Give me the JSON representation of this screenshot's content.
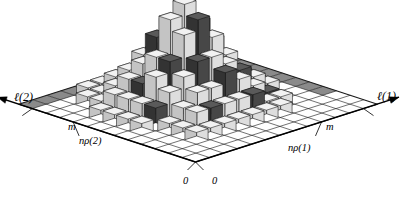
{
  "figure": {
    "title": "",
    "background": "#ffffff",
    "width": 410,
    "height": 204
  },
  "axes": {
    "x_axis_label": "ℓ(1)",
    "y_axis_label": "ℓ(2)",
    "x_origin_label": "0",
    "y_origin_label": "0",
    "x_m_label": "m",
    "y_m_label": "m",
    "x_rho_label": "nρ(1)",
    "y_rho_label": "nρ(2)"
  },
  "colors": {
    "grid_line": "#1a1a1a",
    "floor_fill": "#ffffff",
    "floor_shaded": "#8a8a8a",
    "bar_top_light": "#f2f2f2",
    "bar_left_light": "#c4c4c4",
    "bar_right_light": "#dedede",
    "bar_top_dark": "#5a5a5a",
    "bar_left_dark": "#333333",
    "bar_right_dark": "#474747",
    "outline": "#111111",
    "axis_arrow": "#000000"
  },
  "chart_data": {
    "type": "bar",
    "subtype": "3d-bar-histogram",
    "title": "",
    "xlabel": "ℓ(1)",
    "ylabel": "ℓ(2)",
    "zlabel": "",
    "grid": true,
    "legend_position": "none",
    "x_ticks": [
      "0",
      "nρ(1)",
      "m"
    ],
    "y_ticks": [
      "0",
      "nρ(2)",
      "m"
    ],
    "nx": 13,
    "ny": 13,
    "xlim": [
      0,
      13
    ],
    "ylim": [
      0,
      13
    ],
    "zlim": [
      0,
      9
    ],
    "tick_index": {
      "x_rho": 9,
      "y_rho": 9,
      "x_m": 12,
      "y_m": 12
    },
    "heights": [
      [
        0,
        0,
        0,
        0,
        0,
        0,
        0,
        0,
        0,
        0,
        0,
        0,
        0
      ],
      [
        0,
        0,
        0,
        0,
        0,
        0,
        0,
        0,
        0,
        0,
        0,
        0,
        0
      ],
      [
        0,
        0,
        1,
        1,
        1,
        1,
        1,
        1,
        1,
        0,
        0,
        0,
        0
      ],
      [
        0,
        0,
        1,
        2,
        2,
        2,
        2,
        2,
        1,
        1,
        0,
        0,
        0
      ],
      [
        0,
        0,
        1,
        2,
        3,
        3,
        4,
        3,
        2,
        1,
        0,
        0,
        0
      ],
      [
        0,
        1,
        2,
        3,
        4,
        5,
        5,
        4,
        3,
        2,
        1,
        0,
        0
      ],
      [
        0,
        1,
        2,
        4,
        5,
        7,
        8,
        6,
        4,
        2,
        1,
        0,
        0
      ],
      [
        0,
        1,
        2,
        3,
        5,
        8,
        9,
        7,
        5,
        2,
        1,
        0,
        0
      ],
      [
        0,
        1,
        2,
        3,
        4,
        6,
        7,
        5,
        3,
        2,
        1,
        0,
        0
      ],
      [
        0,
        0,
        1,
        2,
        3,
        4,
        4,
        3,
        2,
        1,
        0,
        0,
        0
      ],
      [
        0,
        0,
        1,
        1,
        2,
        2,
        2,
        2,
        1,
        1,
        0,
        0,
        0
      ],
      [
        0,
        0,
        0,
        1,
        1,
        1,
        1,
        1,
        0,
        0,
        0,
        0,
        0
      ],
      [
        0,
        0,
        0,
        0,
        0,
        0,
        0,
        0,
        0,
        0,
        0,
        0,
        0
      ]
    ],
    "dark_cells": [
      [
        4,
        6
      ],
      [
        5,
        5
      ],
      [
        5,
        8
      ],
      [
        6,
        4
      ],
      [
        6,
        6
      ],
      [
        6,
        9
      ],
      [
        7,
        3
      ],
      [
        7,
        7
      ],
      [
        8,
        5
      ],
      [
        8,
        9
      ],
      [
        9,
        4
      ],
      [
        9,
        7
      ],
      [
        3,
        7
      ],
      [
        10,
        6
      ],
      [
        2,
        5
      ],
      [
        11,
        5
      ],
      [
        4,
        3
      ],
      [
        10,
        9
      ]
    ],
    "dark_floor_cells": [
      [
        12,
        3
      ],
      [
        12,
        4
      ],
      [
        12,
        5
      ],
      [
        12,
        6
      ],
      [
        12,
        7
      ],
      [
        12,
        8
      ],
      [
        12,
        9
      ],
      [
        12,
        10
      ],
      [
        12,
        11
      ],
      [
        0,
        12
      ],
      [
        1,
        12
      ],
      [
        2,
        12
      ],
      [
        3,
        12
      ],
      [
        4,
        12
      ],
      [
        9,
        12
      ],
      [
        10,
        12
      ],
      [
        11,
        12
      ]
    ]
  }
}
